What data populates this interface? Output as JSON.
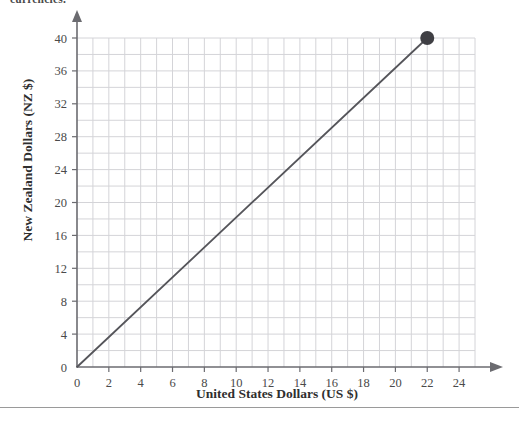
{
  "page": {
    "clipped_heading": "currencies.",
    "background_color": "#ffffff"
  },
  "chart_data": {
    "type": "line",
    "title": "",
    "subtitle": "",
    "xlabel": "United States Dollars (US $)",
    "ylabel": "New Zealand Dollars (NZ $)",
    "xlim": [
      0,
      25
    ],
    "ylim": [
      0,
      41
    ],
    "xticks": [
      0,
      2,
      4,
      6,
      8,
      10,
      12,
      14,
      16,
      18,
      20,
      22,
      24
    ],
    "yticks": [
      0,
      4,
      8,
      12,
      16,
      20,
      24,
      28,
      32,
      36,
      40
    ],
    "xtick_labels": [
      "0",
      "2",
      "4",
      "6",
      "8",
      "10",
      "12",
      "14",
      "16",
      "18",
      "20",
      "22",
      "24"
    ],
    "ytick_labels": [
      "0",
      "4",
      "8",
      "12",
      "16",
      "20",
      "24",
      "28",
      "32",
      "36",
      "40"
    ],
    "grid": true,
    "grid_step_x": 1,
    "grid_step_y": 2,
    "grid_color": "#d4d4d8",
    "legend": null,
    "series": [
      {
        "name": "US $ to NZ $ conversion",
        "type": "line",
        "color": "#55555a",
        "x": [
          0,
          22
        ],
        "values": [
          0,
          40
        ],
        "slope": 1.8181818,
        "intercept": 0
      }
    ],
    "markers": [
      {
        "name": "endpoint",
        "x": 22,
        "y": 40,
        "color": "#3f3f44",
        "radius": 7
      }
    ],
    "axis_arrows": {
      "x": true,
      "y": true
    }
  },
  "axes": {
    "x_title": "United States Dollars (US $)",
    "y_title": "New Zealand Dollars (NZ $)"
  }
}
